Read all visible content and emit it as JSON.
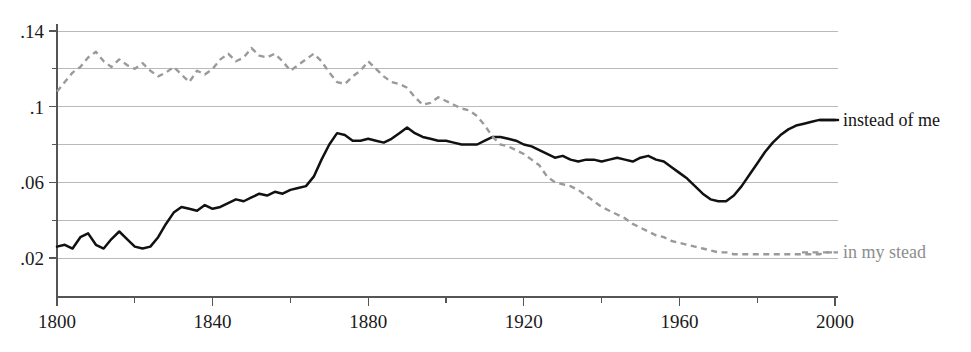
{
  "chart_data": {
    "type": "line",
    "title": "",
    "subtitle": "",
    "xlabel": "",
    "ylabel": "",
    "xlim": [
      1800,
      2000
    ],
    "ylim": [
      0.0,
      0.15
    ],
    "grid": true,
    "grid_axis": "y",
    "legend_position": "right-inline",
    "x_ticks_major": [
      1800,
      1840,
      1880,
      1920,
      1960,
      2000
    ],
    "x_ticks_minor": [
      1820,
      1860,
      1900,
      1940,
      1980
    ],
    "x_tick_labels": [
      "1800",
      "1840",
      "1880",
      "1920",
      "1960",
      "2000"
    ],
    "y_ticks_major": [
      0.02,
      0.06,
      0.1,
      0.14
    ],
    "y_ticks_minor": [
      0.04,
      0.08,
      0.12
    ],
    "y_tick_labels": [
      ".02",
      ".06",
      ".1",
      ".14"
    ],
    "y_gridlines": [
      0.02,
      0.04,
      0.06,
      0.08,
      0.1,
      0.12,
      0.14
    ],
    "series": [
      {
        "name": "instead of me",
        "label": "instead of me",
        "style": "solid",
        "color": "#111111",
        "x": [
          1800,
          1802,
          1804,
          1806,
          1808,
          1810,
          1812,
          1814,
          1816,
          1818,
          1820,
          1822,
          1824,
          1826,
          1828,
          1830,
          1832,
          1834,
          1836,
          1838,
          1840,
          1842,
          1844,
          1846,
          1848,
          1850,
          1852,
          1854,
          1856,
          1858,
          1860,
          1862,
          1864,
          1866,
          1868,
          1870,
          1872,
          1874,
          1876,
          1878,
          1880,
          1882,
          1884,
          1886,
          1888,
          1890,
          1892,
          1894,
          1896,
          1898,
          1900,
          1902,
          1904,
          1906,
          1908,
          1910,
          1912,
          1914,
          1916,
          1918,
          1920,
          1922,
          1924,
          1926,
          1928,
          1930,
          1932,
          1934,
          1936,
          1938,
          1940,
          1942,
          1944,
          1946,
          1948,
          1950,
          1952,
          1954,
          1956,
          1958,
          1960,
          1962,
          1964,
          1966,
          1968,
          1970,
          1972,
          1974,
          1976,
          1978,
          1980,
          1982,
          1984,
          1986,
          1988,
          1990,
          1992,
          1994,
          1996,
          1998,
          2000
        ],
        "y": [
          0.026,
          0.027,
          0.025,
          0.031,
          0.033,
          0.027,
          0.025,
          0.03,
          0.034,
          0.03,
          0.026,
          0.025,
          0.026,
          0.031,
          0.038,
          0.044,
          0.047,
          0.046,
          0.045,
          0.048,
          0.046,
          0.047,
          0.049,
          0.051,
          0.05,
          0.052,
          0.054,
          0.053,
          0.055,
          0.054,
          0.056,
          0.057,
          0.058,
          0.063,
          0.072,
          0.08,
          0.086,
          0.085,
          0.082,
          0.082,
          0.083,
          0.082,
          0.081,
          0.083,
          0.086,
          0.089,
          0.086,
          0.084,
          0.083,
          0.082,
          0.082,
          0.081,
          0.08,
          0.08,
          0.08,
          0.082,
          0.084,
          0.084,
          0.083,
          0.082,
          0.08,
          0.079,
          0.077,
          0.075,
          0.073,
          0.074,
          0.072,
          0.071,
          0.072,
          0.072,
          0.071,
          0.072,
          0.073,
          0.072,
          0.071,
          0.073,
          0.074,
          0.072,
          0.071,
          0.068,
          0.065,
          0.062,
          0.058,
          0.054,
          0.051,
          0.05,
          0.05,
          0.053,
          0.058,
          0.064,
          0.07,
          0.076,
          0.081,
          0.085,
          0.088,
          0.09,
          0.091,
          0.092,
          0.093,
          0.093,
          0.093
        ]
      },
      {
        "name": "in my stead",
        "label": "in my stead",
        "style": "dashed",
        "color": "#9a9a9a",
        "x": [
          1800,
          1802,
          1804,
          1806,
          1808,
          1810,
          1812,
          1814,
          1816,
          1818,
          1820,
          1822,
          1824,
          1826,
          1828,
          1830,
          1832,
          1834,
          1836,
          1838,
          1840,
          1842,
          1844,
          1846,
          1848,
          1850,
          1852,
          1854,
          1856,
          1858,
          1860,
          1862,
          1864,
          1866,
          1868,
          1870,
          1872,
          1874,
          1876,
          1878,
          1880,
          1882,
          1884,
          1886,
          1888,
          1890,
          1892,
          1894,
          1896,
          1898,
          1900,
          1902,
          1904,
          1906,
          1908,
          1910,
          1912,
          1914,
          1916,
          1918,
          1920,
          1922,
          1924,
          1926,
          1928,
          1930,
          1932,
          1934,
          1936,
          1938,
          1940,
          1942,
          1944,
          1946,
          1948,
          1950,
          1952,
          1954,
          1956,
          1958,
          1960,
          1962,
          1964,
          1966,
          1968,
          1970,
          1972,
          1974,
          1976,
          1978,
          1980,
          1982,
          1984,
          1986,
          1988,
          1990,
          1992,
          1994,
          1996,
          1998,
          2000
        ],
        "y": [
          0.108,
          0.113,
          0.118,
          0.121,
          0.126,
          0.129,
          0.124,
          0.121,
          0.125,
          0.122,
          0.12,
          0.123,
          0.119,
          0.116,
          0.118,
          0.121,
          0.117,
          0.113,
          0.119,
          0.117,
          0.12,
          0.125,
          0.128,
          0.124,
          0.126,
          0.131,
          0.127,
          0.126,
          0.128,
          0.124,
          0.119,
          0.122,
          0.125,
          0.128,
          0.124,
          0.118,
          0.113,
          0.112,
          0.116,
          0.119,
          0.124,
          0.12,
          0.116,
          0.113,
          0.112,
          0.11,
          0.105,
          0.101,
          0.102,
          0.105,
          0.103,
          0.101,
          0.099,
          0.098,
          0.095,
          0.09,
          0.084,
          0.08,
          0.079,
          0.077,
          0.075,
          0.072,
          0.069,
          0.063,
          0.06,
          0.059,
          0.058,
          0.056,
          0.053,
          0.05,
          0.047,
          0.045,
          0.043,
          0.041,
          0.038,
          0.036,
          0.034,
          0.032,
          0.031,
          0.029,
          0.028,
          0.027,
          0.026,
          0.025,
          0.024,
          0.023,
          0.023,
          0.022,
          0.022,
          0.022,
          0.022,
          0.022,
          0.022,
          0.022,
          0.022,
          0.022,
          0.022,
          0.022,
          0.022,
          0.023,
          0.023
        ]
      }
    ]
  },
  "legend": {
    "solid_label": "instead of me",
    "dashed_label": "in my stead"
  },
  "colors": {
    "solid": "#111111",
    "dashed": "#9a9a9a",
    "gridline": "#a9a9a9",
    "axis": "#555555",
    "background": "#ffffff"
  }
}
